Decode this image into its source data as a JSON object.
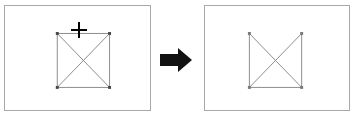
{
  "scene": {
    "title": "Shape edge deletion before and after",
    "background_color": "#ffffff"
  },
  "panels": [
    {
      "id": "before",
      "name": "before-panel",
      "label": "Before",
      "frame": {
        "x": 4,
        "y": 5,
        "width": 147,
        "height": 106
      },
      "border_color": "#a8a8a8",
      "fill_color": "#ffffff",
      "shape": {
        "name": "square-with-diagonals",
        "stroke_color": "#8c8c8c",
        "stroke_width": 1,
        "fill": "none",
        "bounds": {
          "x": 53,
          "y": 28,
          "width": 53,
          "height": 55
        },
        "edges": [
          "top",
          "right",
          "bottom",
          "left"
        ],
        "diagonals": [
          "top-left-to-bottom-right",
          "top-right-to-bottom-left"
        ],
        "handles": {
          "name": "selection-handle",
          "color": "#4a4a4a",
          "size": 3,
          "positions": [
            "top-left",
            "top-right",
            "bottom-left",
            "bottom-right"
          ]
        }
      },
      "cursor": {
        "name": "crosshair-cursor",
        "glyph": "plus-crosshair",
        "color": "#000000",
        "x": 79,
        "y": 30
      }
    },
    {
      "id": "after",
      "name": "after-panel",
      "label": "After",
      "frame": {
        "x": 204,
        "y": 5,
        "width": 146,
        "height": 106
      },
      "border_color": "#a8a8a8",
      "fill_color": "#ffffff",
      "shape": {
        "name": "open-top-box-with-diagonals",
        "stroke_color": "#8c8c8c",
        "stroke_width": 1,
        "fill": "none",
        "bounds": {
          "x": 45,
          "y": 28,
          "width": 53,
          "height": 55
        },
        "edges": [
          "right",
          "bottom",
          "left"
        ],
        "removed_edges": [
          "top"
        ],
        "diagonals": [
          "top-left-to-bottom-right",
          "top-right-to-bottom-left"
        ],
        "handles": {
          "name": "selection-handle",
          "color": "#7a7a7a",
          "size": 3,
          "positions": [
            "top-left",
            "top-right",
            "bottom-left",
            "bottom-right"
          ]
        }
      },
      "cursor": null
    }
  ],
  "arrow": {
    "name": "transition-arrow",
    "direction": "right",
    "color": "#121212",
    "frame": {
      "x": 159,
      "y": 47,
      "width": 34,
      "height": 26
    }
  }
}
